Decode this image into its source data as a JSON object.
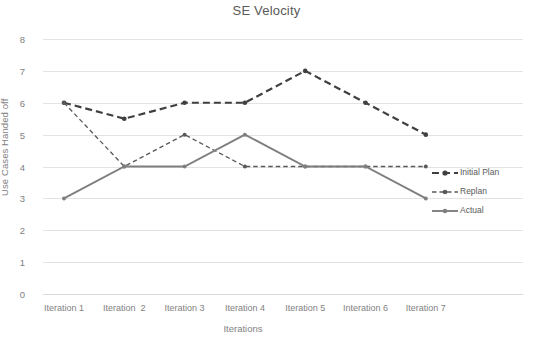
{
  "chart_data": {
    "type": "line",
    "title": "SE Velocity",
    "xlabel": "Iterations",
    "ylabel": "Use Cases Handed off",
    "categories": [
      "Iteration 1",
      "Iteration  2",
      "Iteration 3",
      "Iteration 4",
      "Iteration 5",
      "Interation 6",
      "Iteration 7"
    ],
    "series": [
      {
        "name": "Initial Plan",
        "values": [
          6,
          5.5,
          6,
          6,
          7,
          6,
          5
        ],
        "style": "dashed-thick",
        "color": "#404040"
      },
      {
        "name": "Replan",
        "values": [
          6,
          4,
          5,
          4,
          4,
          4,
          4
        ],
        "style": "dashed-thin",
        "color": "#595959"
      },
      {
        "name": "Actual",
        "values": [
          3,
          4,
          4,
          5,
          4,
          4,
          3
        ],
        "style": "solid",
        "color": "#7f7f7f"
      }
    ],
    "ylim": [
      0,
      8
    ],
    "yticks": [
      "0",
      "1",
      "2",
      "3",
      "4",
      "5",
      "6",
      "7",
      "8"
    ],
    "grid": true,
    "legend_position": "right"
  },
  "legend": {
    "entries": [
      {
        "label": "Initial Plan"
      },
      {
        "label": "Replan"
      },
      {
        "label": "Actual"
      }
    ]
  },
  "colors": {
    "initial_plan": "#404040",
    "replan": "#595959",
    "actual": "#7f7f7f",
    "gridline": "#e3e3e3",
    "text": "#7f7f7f",
    "title": "#595959",
    "background": "#ffffff"
  }
}
